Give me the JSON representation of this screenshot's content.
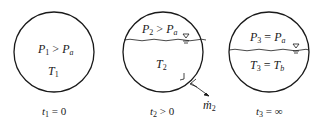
{
  "diagram": {
    "type": "tank-states",
    "states": [
      {
        "id": "state1",
        "pressure_label": {
          "var": "P",
          "sub": "1",
          "op": " > ",
          "rhs": "P",
          "rhs_sub": "a"
        },
        "temp_label": {
          "var": "T",
          "sub": "1"
        },
        "time_label": {
          "var": "t",
          "sub": "1",
          "rest": " = 0"
        },
        "has_liquid_surface": false
      },
      {
        "id": "state2",
        "pressure_label": {
          "var": "P",
          "sub": "2",
          "op": " > ",
          "rhs": "P",
          "rhs_sub": "a"
        },
        "temp_label": {
          "var": "T",
          "sub": "2"
        },
        "time_label": {
          "var": "t",
          "sub": "2",
          "rest": " > 0"
        },
        "has_liquid_surface": true,
        "outflow_label": {
          "var": "ṁ",
          "sub": "2"
        }
      },
      {
        "id": "state3",
        "pressure_label": {
          "var": "P",
          "sub": "3",
          "op": " = ",
          "rhs": "P",
          "rhs_sub": "a"
        },
        "temp_label": {
          "var": "T",
          "sub": "3",
          "op": " = ",
          "rhs": "T",
          "rhs_sub": "b"
        },
        "time_label": {
          "var": "t",
          "sub": "3",
          "rest": " = ∞"
        },
        "has_liquid_surface": true
      }
    ],
    "colors": {
      "line": "#1a1a1a",
      "background": "#ffffff"
    }
  }
}
